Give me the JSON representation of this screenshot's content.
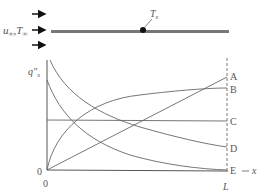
{
  "diagram": {
    "flow_label": "u∞, T∞",
    "flow_label_parts": {
      "u": "u",
      "sub1": "∞",
      "comma": ",",
      "T": "T",
      "sub2": "∞"
    },
    "surface_temp_label": {
      "main": "T",
      "sub": "s"
    },
    "y_axis_label": {
      "main": "q″",
      "sub": "s"
    },
    "origin_y_label": "0",
    "origin_x_label": "0",
    "x_end_label": "L",
    "x_axis_label": "x",
    "curve_labels": [
      "A",
      "B",
      "C",
      "D",
      "E"
    ],
    "colors": {
      "curve": "#666666",
      "plate": "#777777",
      "text": "#555555",
      "arrow": "#111111"
    }
  }
}
